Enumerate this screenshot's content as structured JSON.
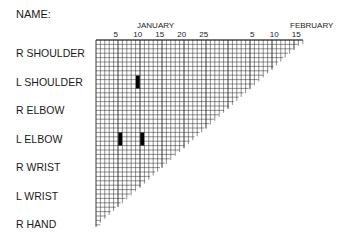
{
  "header": {
    "name_label": "NAME:"
  },
  "chart_data": {
    "type": "heatmap",
    "title": "",
    "x_months": [
      {
        "label": "JANUARY",
        "start_day_index": 1
      },
      {
        "label": "FEBRUARY",
        "start_day_index": 32
      }
    ],
    "x_ticks": [
      {
        "label": "5",
        "day_index": 5
      },
      {
        "label": "10",
        "day_index": 10
      },
      {
        "label": "15",
        "day_index": 15
      },
      {
        "label": "20",
        "day_index": 20
      },
      {
        "label": "25",
        "day_index": 25
      },
      {
        "label": "5",
        "day_index": 36
      },
      {
        "label": "10",
        "day_index": 41
      },
      {
        "label": "15",
        "day_index": 46
      }
    ],
    "rows": [
      "R SHOULDER",
      "L SHOULDER",
      "R ELBOW",
      "L ELBOW",
      "R WRIST",
      "L WRIST",
      "R HAND"
    ],
    "total_days": 47,
    "marks": [
      {
        "row": "L SHOULDER",
        "day_index": 10,
        "date": "January 10"
      },
      {
        "row": "L ELBOW",
        "day_index": 6,
        "date": "January 6"
      },
      {
        "row": "L ELBOW",
        "day_index": 11,
        "date": "January 11"
      }
    ],
    "xlabel": "",
    "ylabel": "",
    "grid": true
  },
  "colors": {
    "grid": "#222222",
    "mark": "#000000",
    "background": "#ffffff"
  }
}
